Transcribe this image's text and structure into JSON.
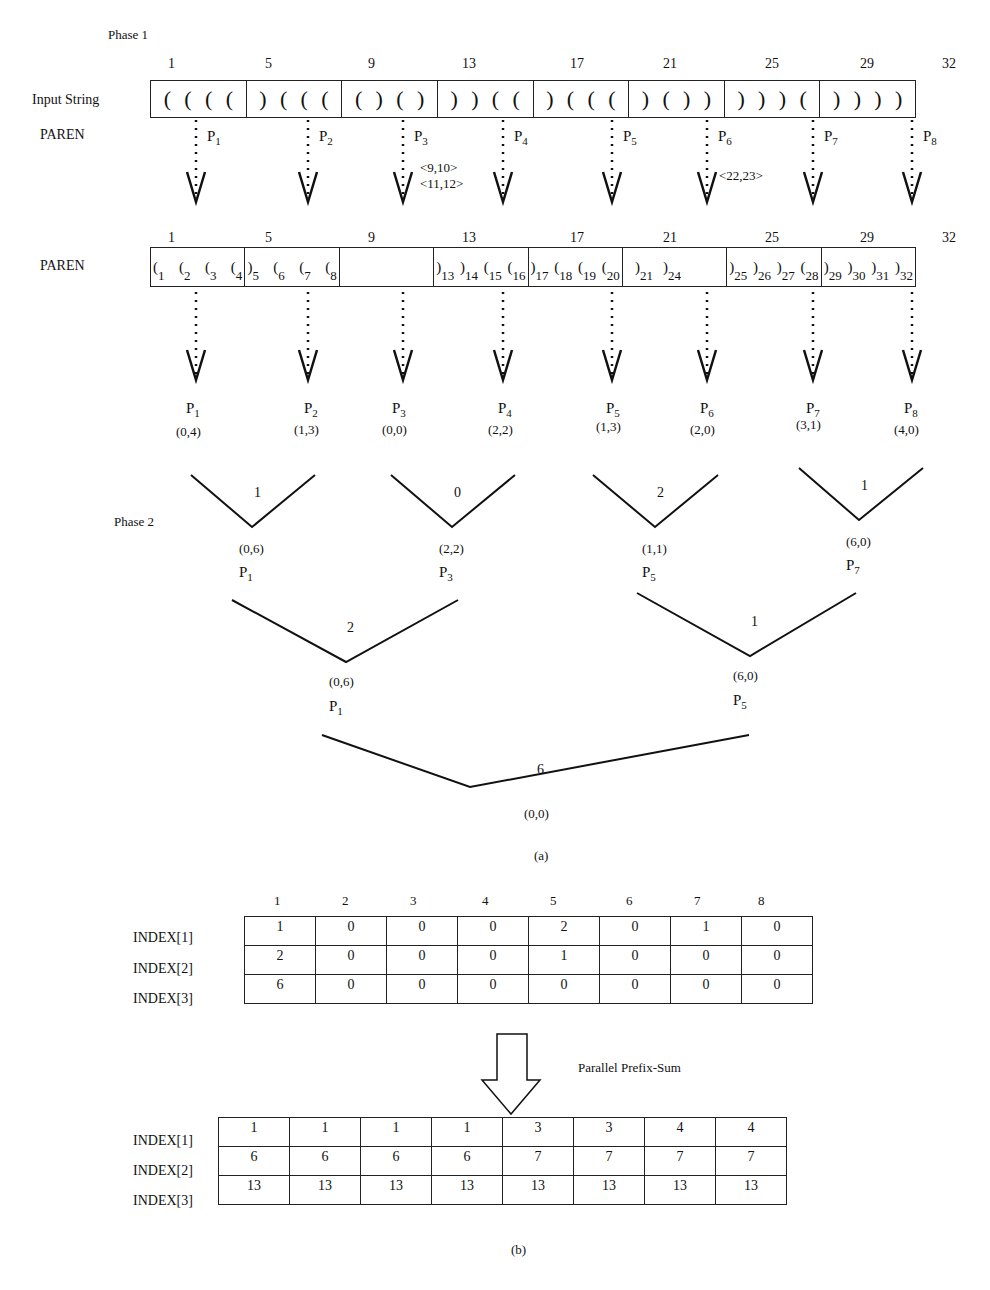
{
  "figure": {
    "phase1_label": "Phase 1",
    "phase2_label": "Phase 2",
    "caption_a": "(a)",
    "caption_b": "(b)"
  },
  "input_row": {
    "label": "Input String",
    "position_ticks": [
      "1",
      "5",
      "9",
      "13",
      "17",
      "21",
      "25",
      "29",
      "32"
    ],
    "blocks": [
      "( ( ( (",
      ") ( ( (",
      "( ) ( )",
      ") ) ( (",
      ") ( ( (",
      ") ( ) )",
      ") ) ) (",
      ") ) ) )"
    ]
  },
  "processors_phase1": {
    "row_label": "PAREN",
    "labels": [
      {
        "name": "P",
        "sub": "1"
      },
      {
        "name": "P",
        "sub": "2"
      },
      {
        "name": "P",
        "sub": "3"
      },
      {
        "name": "P",
        "sub": "4"
      },
      {
        "name": "P",
        "sub": "5"
      },
      {
        "name": "P",
        "sub": "6"
      },
      {
        "name": "P",
        "sub": "7"
      },
      {
        "name": "P",
        "sub": "8"
      }
    ],
    "matched_pairs_p3": [
      "<9,10>",
      "<11,12>"
    ],
    "matched_pairs_p6": "<22,23>"
  },
  "paren_row": {
    "label": "PAREN",
    "position_ticks": [
      "1",
      "5",
      "9",
      "13",
      "17",
      "21",
      "25",
      "29",
      "32"
    ],
    "blocks": [
      [
        {
          "s": "(",
          "i": "1"
        },
        {
          "s": "(",
          "i": "2"
        },
        {
          "s": "(",
          "i": "3"
        },
        {
          "s": "(",
          "i": "4"
        }
      ],
      [
        {
          "s": ")",
          "i": "5"
        },
        {
          "s": "(",
          "i": "6"
        },
        {
          "s": "(",
          "i": "7"
        },
        {
          "s": "(",
          "i": "8"
        }
      ],
      [],
      [
        {
          "s": ")",
          "i": "13"
        },
        {
          "s": ")",
          "i": "14"
        },
        {
          "s": "(",
          "i": "15"
        },
        {
          "s": "(",
          "i": "16"
        }
      ],
      [
        {
          "s": ")",
          "i": "17"
        },
        {
          "s": "(",
          "i": "18"
        },
        {
          "s": "(",
          "i": "19"
        },
        {
          "s": "(",
          "i": "20"
        }
      ],
      [
        {
          "s": ")",
          "i": "21"
        },
        {
          "s": ")",
          "i": "24"
        }
      ],
      [
        {
          "s": ")",
          "i": "25"
        },
        {
          "s": ")",
          "i": "26"
        },
        {
          "s": ")",
          "i": "27"
        },
        {
          "s": "(",
          "i": "28"
        }
      ],
      [
        {
          "s": ")",
          "i": "29"
        },
        {
          "s": ")",
          "i": "30"
        },
        {
          "s": ")",
          "i": "31"
        },
        {
          "s": ")",
          "i": "32"
        }
      ]
    ]
  },
  "tree": {
    "leaves": [
      {
        "proc": "1",
        "pair": "(0,4)"
      },
      {
        "proc": "2",
        "pair": "(1,3)"
      },
      {
        "proc": "3",
        "pair": "(0,0)"
      },
      {
        "proc": "4",
        "pair": "(2,2)"
      },
      {
        "proc": "5",
        "pair": "(1,3)"
      },
      {
        "proc": "6",
        "pair": "(2,0)"
      },
      {
        "proc": "7",
        "pair": "(3,1)"
      },
      {
        "proc": "8",
        "pair": "(4,0)"
      }
    ],
    "level1": [
      {
        "match": "1",
        "pair": "(0,6)",
        "proc": "1"
      },
      {
        "match": "0",
        "pair": "(2,2)",
        "proc": "3"
      },
      {
        "match": "2",
        "pair": "(1,1)",
        "proc": "5"
      },
      {
        "match": "1",
        "pair": "(6,0)",
        "proc": "7"
      }
    ],
    "level2": [
      {
        "match": "2",
        "pair": "(0,6)",
        "proc": "1"
      },
      {
        "match": "1",
        "pair": "(6,0)",
        "proc": "5"
      }
    ],
    "root": {
      "match": "6",
      "pair": "(0,0)"
    }
  },
  "index_table_before": {
    "columns": [
      "1",
      "2",
      "3",
      "4",
      "5",
      "6",
      "7",
      "8"
    ],
    "rows": [
      {
        "label": "INDEX[1]",
        "values": [
          "1",
          "0",
          "0",
          "0",
          "2",
          "0",
          "1",
          "0"
        ]
      },
      {
        "label": "INDEX[2]",
        "values": [
          "2",
          "0",
          "0",
          "0",
          "1",
          "0",
          "0",
          "0"
        ]
      },
      {
        "label": "INDEX[3]",
        "values": [
          "6",
          "0",
          "0",
          "0",
          "0",
          "0",
          "0",
          "0"
        ]
      }
    ]
  },
  "transform_label": "Parallel Prefix-Sum",
  "index_table_after": {
    "rows": [
      {
        "label": "INDEX[1]",
        "values": [
          "1",
          "1",
          "1",
          "1",
          "3",
          "3",
          "4",
          "4"
        ]
      },
      {
        "label": "INDEX[2]",
        "values": [
          "6",
          "6",
          "6",
          "6",
          "7",
          "7",
          "7",
          "7"
        ]
      },
      {
        "label": "INDEX[3]",
        "values": [
          "13",
          "13",
          "13",
          "13",
          "13",
          "13",
          "13",
          "13"
        ]
      }
    ]
  }
}
